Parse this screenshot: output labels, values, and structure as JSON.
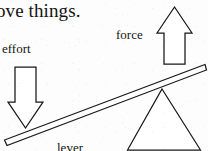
{
  "page": {
    "width": 208,
    "height": 151,
    "background_color": "#fdfdfd",
    "ink_color": "#171717",
    "media": "scanned-textbook-diagram"
  },
  "heading": {
    "text": "ove things.",
    "note": "cropped body text continuing from previous line"
  },
  "diagram": {
    "labels": {
      "effort": "effort",
      "force": "force",
      "lever": "lever"
    },
    "shapes": {
      "effort_arrow": {
        "name": "down-arrow",
        "direction": "down"
      },
      "force_arrow": {
        "name": "up-arrow",
        "direction": "up"
      },
      "lever_bar": {
        "name": "lever-beam",
        "orientation": "tilted"
      },
      "fulcrum": {
        "name": "triangle-fulcrum",
        "orientation": "apex-up"
      }
    }
  }
}
